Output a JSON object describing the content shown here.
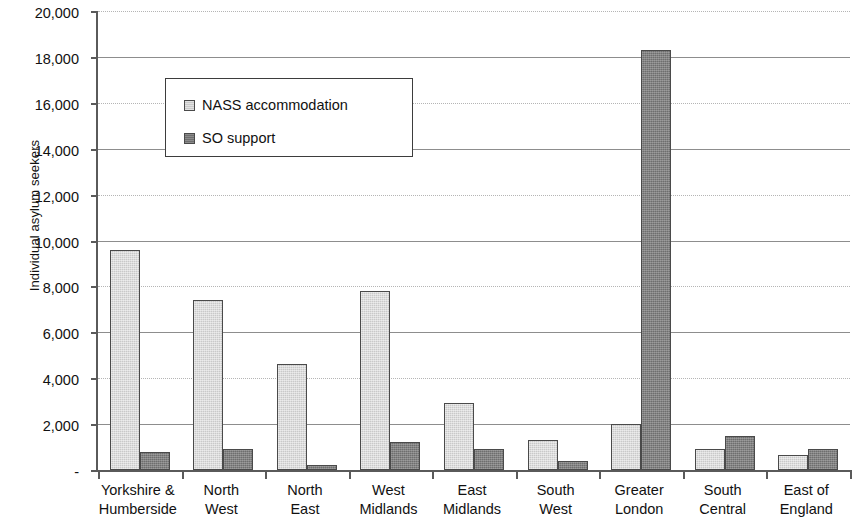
{
  "chart_data": {
    "type": "bar",
    "title": "",
    "xlabel": "",
    "ylabel": "Individual asylum seekers",
    "ylim": [
      0,
      20000
    ],
    "ytick_labels": [
      "20,000",
      "18,000",
      "16,000",
      "14,000",
      "12,000",
      "10,000",
      "8,000",
      "6,000",
      "4,000",
      "2,000",
      "-"
    ],
    "ytick_values": [
      20000,
      18000,
      16000,
      14000,
      12000,
      10000,
      8000,
      6000,
      4000,
      2000,
      0
    ],
    "grid": true,
    "legend_position": "upper-left-inside",
    "categories": [
      "Yorkshire & Humberside",
      "North West",
      "North East",
      "West Midlands",
      "East Midlands",
      "South West",
      "Greater London",
      "South Central",
      "East of England"
    ],
    "category_lines": [
      [
        "Yorkshire &",
        "Humberside"
      ],
      [
        "North",
        "West"
      ],
      [
        "North",
        "East"
      ],
      [
        "West",
        "Midlands"
      ],
      [
        "East",
        "Midlands"
      ],
      [
        "South",
        "West"
      ],
      [
        "Greater",
        "London"
      ],
      [
        "South",
        "Central"
      ],
      [
        "East of",
        "England"
      ]
    ],
    "series": [
      {
        "name": "NASS accommodation",
        "color": "#c9c9c9",
        "values": [
          9600,
          7400,
          4600,
          7800,
          2900,
          1300,
          2000,
          900,
          650
        ]
      },
      {
        "name": "SO support",
        "color": "#6e6e6e",
        "values": [
          800,
          900,
          200,
          1200,
          900,
          400,
          18300,
          1500,
          900
        ]
      }
    ]
  },
  "legend": {
    "items": [
      {
        "label": "NASS accommodation",
        "swatch": "nass"
      },
      {
        "label": "SO support",
        "swatch": "so"
      }
    ]
  }
}
